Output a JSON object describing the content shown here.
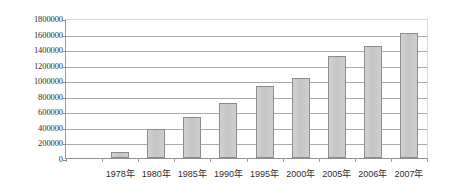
{
  "chart_data": {
    "type": "bar",
    "title": "",
    "subtitle": "",
    "xlabel": "",
    "ylabel": "",
    "categories": [
      "1978年",
      "1980年",
      "1985年",
      "1990年",
      "1995年",
      "2000年",
      "2005年",
      "2006年",
      "2007年"
    ],
    "values": [
      80000,
      380000,
      530000,
      710000,
      930000,
      1030000,
      1320000,
      1450000,
      1620000
    ],
    "ylim": [
      0,
      1800000
    ],
    "ytick_step": 200000,
    "ytick_labels": [
      "0",
      "200000",
      "400000",
      "600000",
      "800000",
      "1000000",
      "1200000",
      "1400000",
      "1600000",
      "1800000"
    ],
    "ytick_values": [
      0,
      200000,
      400000,
      600000,
      800000,
      1000000,
      1200000,
      1400000,
      1600000,
      1800000
    ],
    "grid": true,
    "legend": false,
    "legend_position": "none",
    "series": [
      {
        "name": "",
        "values": [
          80000,
          380000,
          530000,
          710000,
          930000,
          1030000,
          1320000,
          1450000,
          1620000
        ]
      }
    ],
    "colors": {
      "bar_fill": "#c9c9c9",
      "bar_border": "#8c8c8c",
      "gridline": "#a9a9a9",
      "axis": "#8f8f8f",
      "plot_background": "#ffffff",
      "text": "#2e2e2e"
    }
  }
}
